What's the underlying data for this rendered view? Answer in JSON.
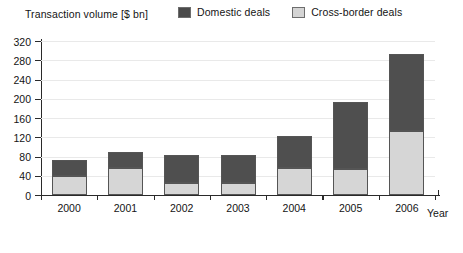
{
  "chart_data": {
    "type": "bar",
    "subtype": "stacked-vertical",
    "title": "",
    "ylabel": "Transaction volume [$ bn]",
    "xlabel": "Year",
    "categories": [
      "2000",
      "2001",
      "2002",
      "2003",
      "2004",
      "2005",
      "2006"
    ],
    "ylim": [
      0,
      320
    ],
    "ytick_step": 40,
    "yticks": [
      0,
      40,
      80,
      120,
      160,
      200,
      240,
      280,
      320
    ],
    "ytick_labels": [
      "0",
      "40",
      "80",
      "120",
      "160",
      "200",
      "240",
      "280",
      "320"
    ],
    "grid": true,
    "grid_axis": "y",
    "legend_position": "top",
    "series": [
      {
        "name": "Cross-border deals",
        "color": "#d6d6d6",
        "stack_order": 0,
        "values": [
          40,
          57,
          25,
          24,
          57,
          55,
          133
        ]
      },
      {
        "name": "Domestic deals",
        "color": "#4f4f4f",
        "stack_order": 1,
        "values": [
          32,
          33,
          59,
          59,
          65,
          138,
          159
        ]
      }
    ],
    "totals": [
      72,
      90,
      84,
      83,
      122,
      193,
      292
    ]
  },
  "legend": {
    "items": [
      {
        "label": "Domestic deals",
        "swatch": "dark-swatch-icon"
      },
      {
        "label": "Cross-border deals",
        "swatch": "light-swatch-icon"
      }
    ]
  },
  "colors": {
    "domestic": "#4f4f4f",
    "cross_border": "#d6d6d6",
    "axis": "#2a2a2a",
    "grid": "#e9e9e9",
    "background": "#ffffff"
  }
}
